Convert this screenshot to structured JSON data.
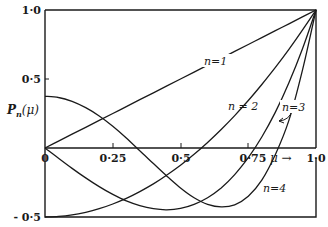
{
  "chart_data": {
    "type": "line",
    "title": "",
    "xlabel": "μ →",
    "ylabel": "P_n(μ)",
    "xlim": [
      0,
      1.0
    ],
    "ylim": [
      -0.5,
      1.0
    ],
    "grid": false,
    "legend_position": "inline labels",
    "x_ticks": [
      "0",
      "0·25",
      "0·5",
      "0·75",
      "1·0"
    ],
    "y_ticks": [
      "1·0",
      "0·5",
      "- 0·5"
    ],
    "x": [
      0,
      0.05,
      0.1,
      0.15,
      0.2,
      0.25,
      0.3,
      0.35,
      0.4,
      0.45,
      0.5,
      0.55,
      0.6,
      0.65,
      0.7,
      0.75,
      0.8,
      0.85,
      0.9,
      0.95,
      1.0
    ],
    "series": [
      {
        "name": "n=1",
        "values": [
          0,
          0.05,
          0.1,
          0.15,
          0.2,
          0.25,
          0.3,
          0.35,
          0.4,
          0.45,
          0.5,
          0.55,
          0.6,
          0.65,
          0.7,
          0.75,
          0.8,
          0.85,
          0.9,
          0.95,
          1.0
        ]
      },
      {
        "name": "n=2",
        "values": [
          -0.5,
          -0.496,
          -0.485,
          -0.466,
          -0.44,
          -0.406,
          -0.365,
          -0.316,
          -0.26,
          -0.196,
          -0.125,
          -0.046,
          0.04,
          0.134,
          0.235,
          0.344,
          0.46,
          0.584,
          0.715,
          0.854,
          1.0
        ]
      },
      {
        "name": "n=3",
        "values": [
          0,
          -0.075,
          -0.148,
          -0.217,
          -0.28,
          -0.336,
          -0.383,
          -0.418,
          -0.44,
          -0.448,
          -0.438,
          -0.408,
          -0.36,
          -0.289,
          -0.193,
          -0.07,
          0.08,
          0.26,
          0.473,
          0.718,
          1.0
        ]
      },
      {
        "name": "n=4",
        "values": [
          0.375,
          0.366,
          0.338,
          0.292,
          0.232,
          0.158,
          0.073,
          -0.02,
          -0.113,
          -0.204,
          -0.289,
          -0.36,
          -0.408,
          -0.427,
          -0.412,
          -0.35,
          -0.233,
          -0.047,
          0.2,
          0.563,
          1.0
        ]
      }
    ],
    "annotations": [
      "n=1",
      "n = 2",
      "n=3",
      "n=4"
    ]
  },
  "labels": {
    "y_top": "1·0",
    "y_mid": "0·5",
    "y_bottom": "- 0·5",
    "y_axis_title": "P",
    "y_axis_sub": "n",
    "y_axis_arg": "(μ)",
    "x_0": "0",
    "x_025": "0·25",
    "x_05": "0·5",
    "x_075": "0·75",
    "x_mu": "μ →",
    "x_10": "1·0",
    "n1": "n=1",
    "n2": "n = 2",
    "n3": "n=3",
    "n4": "n=4"
  }
}
